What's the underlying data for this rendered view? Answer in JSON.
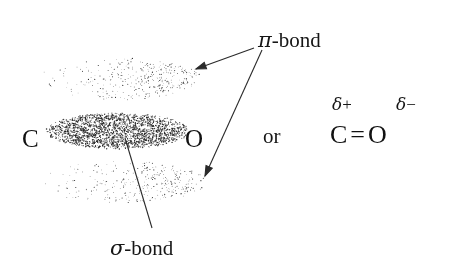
{
  "figure": {
    "background_color": "#ffffff",
    "ink_color": "#1a1a1a"
  },
  "orbital_diagram": {
    "atom_labels": [
      {
        "name": "carbon",
        "text": "C",
        "x": 22,
        "y": 126
      },
      {
        "name": "oxygen",
        "text": "O",
        "x": 185,
        "y": 126
      }
    ],
    "clouds": [
      {
        "name": "pi-lobe-top",
        "role": "pi",
        "cx": 120,
        "cy": 79,
        "rx": 82,
        "ry": 21,
        "density": 900,
        "dot_min": 0.5,
        "dot_max": 1.15,
        "gradient": "left-sparse-right-dense"
      },
      {
        "name": "sigma-cloud",
        "role": "sigma",
        "cx": 118,
        "cy": 131,
        "rx": 72,
        "ry": 18,
        "density": 2600,
        "dot_min": 0.7,
        "dot_max": 1.5,
        "gradient": "uniform-dense"
      },
      {
        "name": "pi-lobe-bottom",
        "role": "pi",
        "cx": 122,
        "cy": 182,
        "rx": 84,
        "ry": 21,
        "density": 900,
        "dot_min": 0.5,
        "dot_max": 1.15,
        "gradient": "left-sparse-right-dense"
      }
    ],
    "leaders": [
      {
        "name": "pi-leader-top",
        "from_x": 254,
        "from_y": 48,
        "to_x": 196,
        "to_y": 69,
        "arrowhead": true
      },
      {
        "name": "pi-leader-bottom",
        "from_x": 262,
        "from_y": 50,
        "to_x": 205,
        "to_y": 176,
        "arrowhead": true
      },
      {
        "name": "sigma-leader",
        "from_x": 152,
        "from_y": 228,
        "to_x": 125,
        "to_y": 138,
        "arrowhead": false
      }
    ],
    "callouts": [
      {
        "name": "pi-bond-label",
        "greek": "π",
        "suffix": "-bond",
        "x": 258,
        "y": 30
      },
      {
        "name": "sigma-bond-label",
        "greek": "σ",
        "suffix": "-bond",
        "x": 110,
        "y": 238
      }
    ]
  },
  "alternative": {
    "connector_text": "or",
    "connector_x": 263,
    "connector_y": 126,
    "formula": {
      "left_atom": "C",
      "bond_symbol": "=",
      "right_atom": "O",
      "x": 330,
      "y": 122
    },
    "charges": [
      {
        "name": "partial-positive-charge",
        "greek": "δ",
        "sign": "+",
        "x": 332,
        "y": 96,
        "applies_to": "C"
      },
      {
        "name": "partial-negative-charge",
        "greek": "δ",
        "sign": "−",
        "x": 396,
        "y": 96,
        "applies_to": "O"
      }
    ]
  }
}
